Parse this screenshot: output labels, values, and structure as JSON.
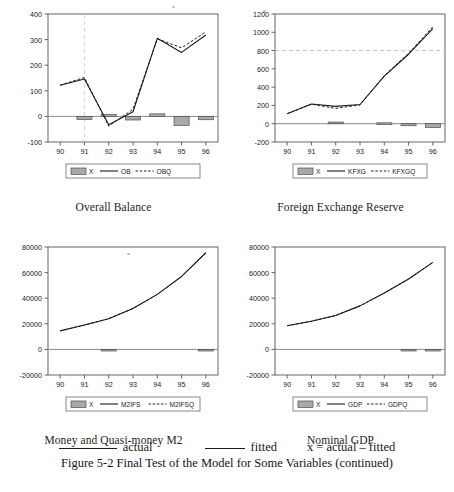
{
  "figure": {
    "caption": "Figure 5-2  Final Test of the Model for Some Variables (continued)",
    "legend_actual": "actual",
    "legend_fitted": "fitted",
    "legend_x_formula": "x = actual – fitted"
  },
  "charts": [
    {
      "id": "overall-balance",
      "title": "Overall Balance",
      "legend": [
        "X",
        "OB",
        "OBQ"
      ],
      "chart_data": {
        "type": "line",
        "title": "Overall Balance",
        "xlabel": "",
        "ylabel": "",
        "categories": [
          "90",
          "91",
          "92",
          "93",
          "94",
          "95",
          "96"
        ],
        "ylim": [
          -100,
          400
        ],
        "yticks": [
          -100,
          0,
          100,
          200,
          300,
          400
        ],
        "grid": false,
        "legend_position": "bottom",
        "series": [
          {
            "name": "OB",
            "type": "line",
            "dash": false,
            "values": [
              122,
              146,
              -33,
              18,
              305,
              250,
              318
            ]
          },
          {
            "name": "OBQ",
            "type": "line",
            "dash": true,
            "values": [
              122,
              152,
              -38,
              28,
              303,
              268,
              330
            ]
          },
          {
            "name": "X",
            "type": "bar",
            "values": [
              0,
              -12,
              8,
              -14,
              10,
              -35,
              -13
            ]
          }
        ]
      }
    },
    {
      "id": "foreign-exchange-reserve",
      "title": "Foreign Exchange Reserve",
      "legend": [
        "X",
        "KFXG",
        "KFXGQ"
      ],
      "chart_data": {
        "type": "line",
        "title": "Foreign Exchange Reserve",
        "xlabel": "",
        "ylabel": "",
        "categories": [
          "90",
          "91",
          "92",
          "93",
          "94",
          "95",
          "96"
        ],
        "ylim": [
          -200,
          1200
        ],
        "yticks": [
          -200,
          0,
          200,
          400,
          600,
          800,
          1000,
          1200
        ],
        "grid": false,
        "gridline_dashed_at": 800,
        "legend_position": "bottom",
        "series": [
          {
            "name": "KFXG",
            "type": "line",
            "dash": false,
            "values": [
              110,
              215,
              190,
              210,
              520,
              760,
              1040
            ]
          },
          {
            "name": "KFXGQ",
            "type": "line",
            "dash": true,
            "values": [
              110,
              213,
              168,
              205,
              525,
              770,
              1060
            ]
          },
          {
            "name": "X",
            "type": "bar",
            "values": [
              0,
              0,
              18,
              0,
              10,
              -22,
              -40
            ]
          }
        ]
      }
    },
    {
      "id": "money-quasi-money-m2",
      "title": "Money and Quasi-money M2",
      "legend": [
        "X",
        "M2IFS",
        "M2IFSQ"
      ],
      "chart_data": {
        "type": "line",
        "title": "Money and Quasi-money M2",
        "xlabel": "",
        "ylabel": "",
        "categories": [
          "90",
          "91",
          "92",
          "93",
          "94",
          "95",
          "96"
        ],
        "ylim": [
          -20000,
          80000
        ],
        "yticks": [
          -20000,
          0,
          20000,
          40000,
          60000,
          80000
        ],
        "grid": false,
        "legend_position": "bottom",
        "series": [
          {
            "name": "M2IFS",
            "type": "line",
            "dash": false,
            "values": [
              14500,
              19000,
              24000,
              32000,
              43000,
              57000,
              75500
            ]
          },
          {
            "name": "M2IFSQ",
            "type": "line",
            "dash": true,
            "values": [
              14500,
              19000,
              24000,
              32000,
              43000,
              57000,
              75500
            ]
          },
          {
            "name": "X",
            "type": "bar",
            "values": [
              0,
              0,
              -400,
              0,
              0,
              0,
              -500
            ]
          }
        ]
      }
    },
    {
      "id": "nominal-gdp",
      "title": "Nominal GDP",
      "legend": [
        "X",
        "GDP",
        "GDPQ"
      ],
      "chart_data": {
        "type": "line",
        "title": "Nominal GDP",
        "xlabel": "",
        "ylabel": "",
        "categories": [
          "90",
          "91",
          "92",
          "93",
          "94",
          "95",
          "96"
        ],
        "ylim": [
          -20000,
          80000
        ],
        "yticks": [
          -20000,
          0,
          20000,
          40000,
          60000,
          80000
        ],
        "grid": false,
        "legend_position": "bottom",
        "series": [
          {
            "name": "GDP",
            "type": "line",
            "dash": false,
            "values": [
              18500,
              22000,
              26500,
              34000,
              44000,
              55000,
              68000
            ]
          },
          {
            "name": "GDPQ",
            "type": "line",
            "dash": true,
            "values": [
              18500,
              22000,
              26500,
              34000,
              44000,
              55000,
              68000
            ]
          },
          {
            "name": "X",
            "type": "bar",
            "values": [
              0,
              0,
              0,
              0,
              0,
              -700,
              -700
            ]
          }
        ]
      }
    }
  ],
  "colors": {
    "line": "#1a1a1a",
    "bar_fill": "#a9a9a9",
    "bar_stroke": "#4d4d4d",
    "axis": "#555555",
    "grid_dashed": "#bbbbbb",
    "text": "#1a1a1a"
  }
}
